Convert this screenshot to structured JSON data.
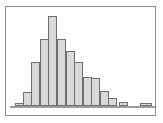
{
  "figure": {
    "background_color": "#ffffff",
    "frame_color": "#8c8c8c",
    "baseline_color": "#9a9a9a"
  },
  "chart_data": {
    "type": "bar",
    "title": "",
    "subtitle": "",
    "xlabel": "",
    "ylabel": "",
    "grid": false,
    "legend": null,
    "axis_ticks_visible": false,
    "tick_labels_visible": false,
    "bar_fill_color": "#d9d9d9",
    "bar_edge_color": "#6e6e6e",
    "orientation": "vertical",
    "shape": "right-skewed unimodal histogram",
    "categories": [
      "bin-1",
      "bin-2",
      "bin-3",
      "bin-4",
      "bin-5",
      "bin-6",
      "bin-7",
      "bin-8",
      "bin-9",
      "bin-10",
      "bin-11",
      "bin-12",
      "bin-13",
      "bin-14",
      "bin-15"
    ],
    "values": [
      3,
      16,
      49,
      75,
      100,
      75,
      61,
      49,
      32,
      31,
      17,
      9,
      5,
      0,
      3
    ],
    "ylim": [
      0,
      100
    ],
    "xlim": [
      0,
      15
    ],
    "bars": [
      {
        "index": 1,
        "left": 9,
        "width": 8.5,
        "value": 3
      },
      {
        "index": 2,
        "left": 17,
        "width": 8.5,
        "value": 16
      },
      {
        "index": 3,
        "left": 25,
        "width": 8.5,
        "value": 49
      },
      {
        "index": 4,
        "left": 34,
        "width": 8.5,
        "value": 75
      },
      {
        "index": 5,
        "left": 42,
        "width": 8.5,
        "value": 100
      },
      {
        "index": 6,
        "left": 51,
        "width": 8.5,
        "value": 75
      },
      {
        "index": 7,
        "left": 60,
        "width": 8.5,
        "value": 61
      },
      {
        "index": 8,
        "left": 68,
        "width": 8.5,
        "value": 49
      },
      {
        "index": 9,
        "left": 77,
        "width": 8.5,
        "value": 32
      },
      {
        "index": 10,
        "left": 85,
        "width": 8.5,
        "value": 31
      },
      {
        "index": 11,
        "left": 94,
        "width": 8.5,
        "value": 17
      },
      {
        "index": 12,
        "left": 102,
        "width": 8.5,
        "value": 9
      },
      {
        "index": 13,
        "left": 113,
        "width": 8.5,
        "value": 5
      },
      {
        "index": 14,
        "left": 121,
        "width": 8.5,
        "value": 0
      },
      {
        "index": 15,
        "left": 134,
        "width": 12.0,
        "value": 3
      }
    ]
  }
}
